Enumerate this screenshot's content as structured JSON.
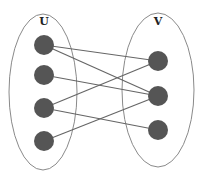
{
  "colors": {
    "node": "#555555",
    "edge": "#666666",
    "ellipse": "#8a8a8a"
  },
  "sets": [
    {
      "name": "U",
      "cx": 43,
      "cy": 92,
      "rx": 34,
      "ry": 78,
      "label_x": 44,
      "label_y": 25,
      "nodes": [
        {
          "id": "u1",
          "x": 44,
          "y": 45
        },
        {
          "id": "u2",
          "x": 44,
          "y": 75
        },
        {
          "id": "u3",
          "x": 44,
          "y": 108
        },
        {
          "id": "u4",
          "x": 44,
          "y": 141
        }
      ]
    },
    {
      "name": "V",
      "cx": 158,
      "cy": 90,
      "rx": 36,
      "ry": 77,
      "label_x": 158,
      "label_y": 25,
      "nodes": [
        {
          "id": "v1",
          "x": 158,
          "y": 61
        },
        {
          "id": "v2",
          "x": 158,
          "y": 96
        },
        {
          "id": "v3",
          "x": 158,
          "y": 130
        }
      ]
    }
  ],
  "edges": [
    [
      "u1",
      "v1"
    ],
    [
      "u1",
      "v2"
    ],
    [
      "u2",
      "v2"
    ],
    [
      "u3",
      "v1"
    ],
    [
      "u3",
      "v3"
    ],
    [
      "u4",
      "v2"
    ]
  ],
  "node_radius": 10
}
